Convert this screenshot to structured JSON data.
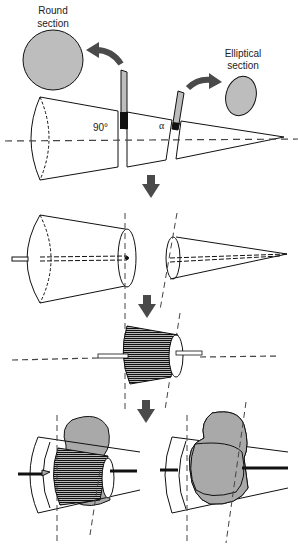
{
  "labels": {
    "round_section_line1": "Round",
    "round_section_line2": "section",
    "elliptical_section_line1": "Elliptical",
    "elliptical_section_line2": "section",
    "angle_90": "90°",
    "angle_alpha": "α"
  },
  "colors": {
    "section_fill": "#bdbdbd",
    "arrow_fill": "#4a4a4a",
    "line": "#111111",
    "tissue_fill": "#a9a9a9"
  },
  "steps": [
    {
      "id": 1,
      "description": "Truncated cone cut perpendicular (90°) giving round section and at angle α giving elliptical section"
    },
    {
      "id": 2,
      "description": "Cone pieces separated with axis rod"
    },
    {
      "id": 3,
      "description": "Frustum wrapped with striated surface on rod"
    },
    {
      "id": 4,
      "description": "Tissue sample mounted within cone frames"
    }
  ]
}
